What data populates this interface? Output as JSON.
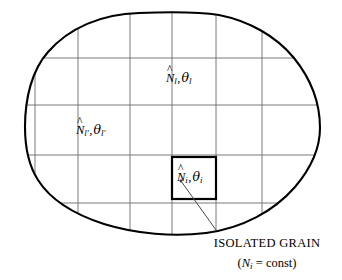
{
  "figure": {
    "type": "technical-diagram",
    "title_caption": "ISOLATED GRAIN",
    "subtitle_caption_parts": {
      "open_paren": "(",
      "symbol": "N",
      "subscript": "i",
      "equals": " = ",
      "value": "const",
      "close_paren": ")"
    },
    "colors": {
      "outline": "#000000",
      "grid": "#6b6b6b",
      "grain_box": "#000000",
      "leader": "#4a4a4a",
      "background": "#ffffff",
      "text": "#000000"
    },
    "labels": [
      {
        "id": "label-l",
        "hat_symbol": "N",
        "hat_mark": "^",
        "hat_subscript": "l",
        "separator": ",",
        "theta_symbol": "θ",
        "theta_subscript": "l",
        "description": "cell-l number density and temperature"
      },
      {
        "id": "label-lp",
        "hat_symbol": "N",
        "hat_mark": "^",
        "hat_subscript": "l′",
        "separator": ",",
        "theta_symbol": "θ",
        "theta_subscript": "l′",
        "description": "cell-l-prime number density and temperature"
      },
      {
        "id": "label-i",
        "hat_symbol": "N",
        "hat_mark": "^",
        "hat_subscript": "i",
        "separator": ",",
        "theta_symbol": "θ",
        "theta_subscript": "i",
        "description": "isolated grain number density and temperature"
      }
    ],
    "grid": {
      "vertical_x": [
        35,
        78,
        130,
        172,
        216,
        262
      ],
      "horizontal_y": [
        58,
        105,
        155,
        203
      ],
      "stroke_width": 0.9
    },
    "grain_box": {
      "x": 172,
      "y": 157,
      "width": 44,
      "height": 42,
      "stroke_width": 2.2
    },
    "leader_line": {
      "from_x": 181,
      "from_y": 181,
      "to_x": 216,
      "to_y": 230,
      "dot_radius": 1.4
    },
    "outline_stroke_width": 2.1
  }
}
